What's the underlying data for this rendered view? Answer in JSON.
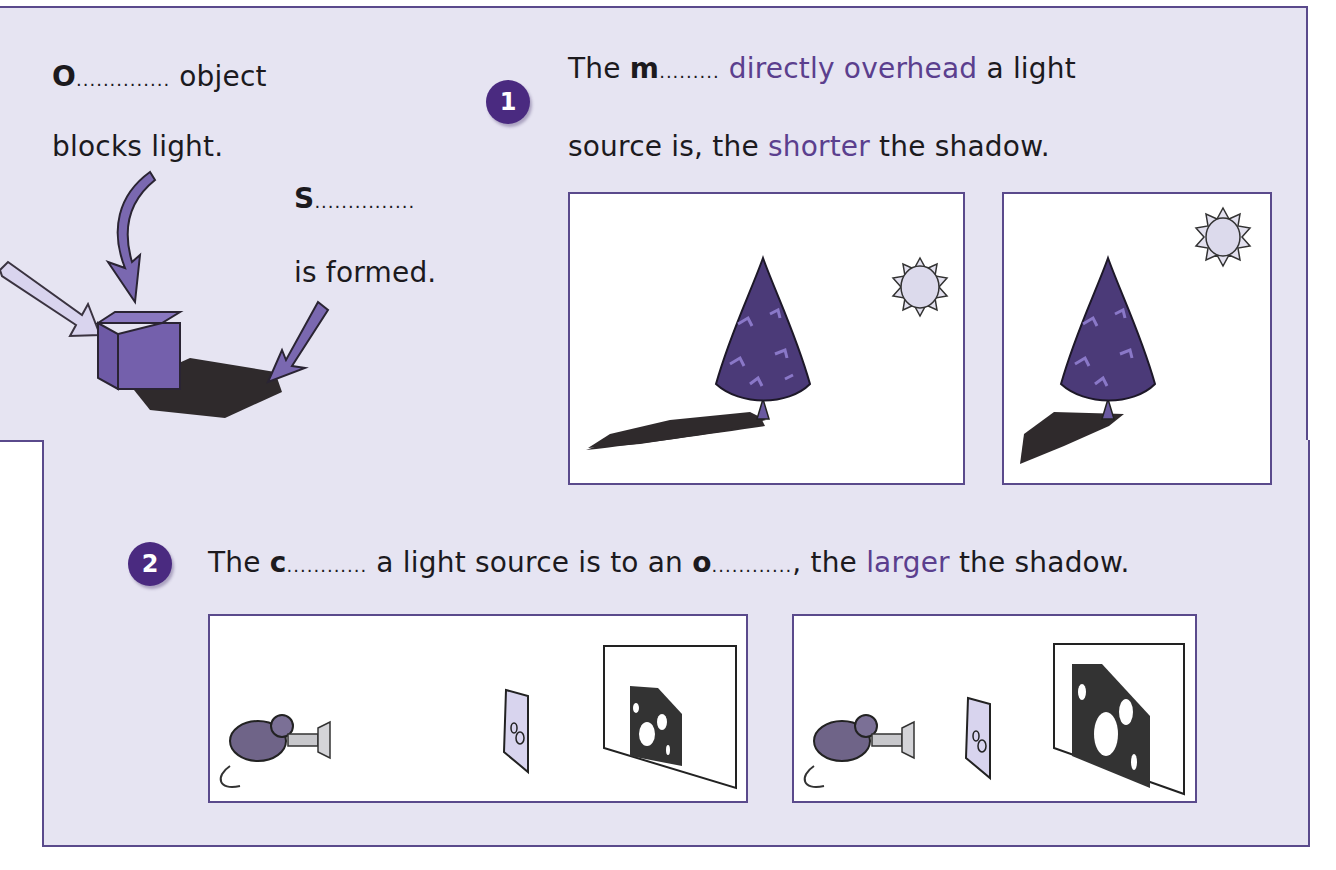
{
  "worksheet": {
    "intro": {
      "opaque_letter": "O",
      "opaque_blank": "..............",
      "opaque_suffix": " object",
      "line2": "blocks light.",
      "shadow_letter": "S",
      "shadow_blank": "...............",
      "formed": "is formed."
    },
    "item1": {
      "number": "1",
      "prefix": "The ",
      "letter": "m",
      "blank": ".........",
      "accent_phrase": " directly overhead",
      "suffix": " a light",
      "line2_prefix": "source is, the ",
      "line2_accent": "shorter",
      "line2_suffix": " the shadow."
    },
    "item2": {
      "number": "2",
      "prefix": "The ",
      "letter1": "c",
      "blank1": "............",
      "middle": " a light source is to an ",
      "letter2": "o",
      "blank2": "............",
      "comma_prefix": ", the ",
      "accent": "larger",
      "suffix": " the shadow."
    },
    "colors": {
      "panel": "#e6e4f2",
      "border": "#5a4a8c",
      "badge": "#4a2a80",
      "accent_text": "#5b3f8e",
      "shadow": "#2f2a2c",
      "cube": "#6e5aa6"
    }
  }
}
